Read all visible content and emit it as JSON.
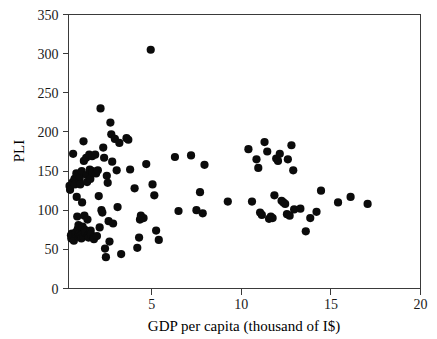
{
  "chart_data": {
    "type": "scatter",
    "title": "",
    "xlabel": "GDP per capita (thousand of I$)",
    "ylabel": "PLI",
    "xlim": [
      0,
      20
    ],
    "ylim": [
      0,
      350
    ],
    "xticks": [
      5,
      10,
      15,
      20
    ],
    "yticks": [
      0,
      50,
      100,
      150,
      200,
      250,
      300,
      350
    ],
    "xtick_labels": [
      "5",
      "10",
      "15",
      "20"
    ],
    "ytick_labels": [
      "0",
      "50",
      "100",
      "150",
      "200",
      "250",
      "300",
      "350"
    ],
    "grid": false,
    "legend": null,
    "marker": "filled-circle",
    "marker_color": "#0b0b0b",
    "marker_size": 4.1,
    "series": [
      {
        "name": "countries",
        "points": [
          [
            0.42,
            131
          ],
          [
            0.45,
            126
          ],
          [
            0.5,
            68
          ],
          [
            0.52,
            64
          ],
          [
            0.55,
            70
          ],
          [
            0.58,
            67
          ],
          [
            0.6,
            136
          ],
          [
            0.62,
            172
          ],
          [
            0.66,
            61
          ],
          [
            0.7,
            140
          ],
          [
            0.72,
            133
          ],
          [
            0.75,
            70
          ],
          [
            0.78,
            72
          ],
          [
            0.8,
            147
          ],
          [
            0.82,
            117
          ],
          [
            0.85,
            92
          ],
          [
            0.88,
            76
          ],
          [
            0.9,
            66
          ],
          [
            0.92,
            81
          ],
          [
            0.95,
            69
          ],
          [
            0.98,
            138
          ],
          [
            1.0,
            143
          ],
          [
            1.02,
            133
          ],
          [
            1.05,
            68
          ],
          [
            1.08,
            64
          ],
          [
            1.1,
            150
          ],
          [
            1.12,
            110
          ],
          [
            1.15,
            79
          ],
          [
            1.18,
            66
          ],
          [
            1.2,
            188
          ],
          [
            1.22,
            163
          ],
          [
            1.25,
            93
          ],
          [
            1.28,
            75
          ],
          [
            1.3,
            71
          ],
          [
            1.35,
            167
          ],
          [
            1.38,
            145
          ],
          [
            1.4,
            136
          ],
          [
            1.42,
            88
          ],
          [
            1.45,
            68
          ],
          [
            1.48,
            65
          ],
          [
            1.52,
            171
          ],
          [
            1.55,
            152
          ],
          [
            1.58,
            140
          ],
          [
            1.6,
            74
          ],
          [
            1.62,
            69
          ],
          [
            1.68,
            169
          ],
          [
            1.7,
            150
          ],
          [
            1.72,
            148
          ],
          [
            1.75,
            65
          ],
          [
            1.78,
            63
          ],
          [
            1.85,
            171
          ],
          [
            1.9,
            147
          ],
          [
            1.95,
            67
          ],
          [
            2.0,
            151
          ],
          [
            2.05,
            118
          ],
          [
            2.1,
            78
          ],
          [
            2.15,
            230
          ],
          [
            2.2,
            100
          ],
          [
            2.25,
            97
          ],
          [
            2.3,
            180
          ],
          [
            2.35,
            167
          ],
          [
            2.4,
            51
          ],
          [
            2.45,
            40
          ],
          [
            2.5,
            144
          ],
          [
            2.55,
            135
          ],
          [
            2.6,
            86
          ],
          [
            2.65,
            60
          ],
          [
            2.7,
            212
          ],
          [
            2.75,
            197
          ],
          [
            2.8,
            162
          ],
          [
            2.85,
            83
          ],
          [
            2.95,
            191
          ],
          [
            3.05,
            151
          ],
          [
            3.1,
            104
          ],
          [
            3.2,
            186
          ],
          [
            3.3,
            44
          ],
          [
            3.6,
            192
          ],
          [
            3.7,
            190
          ],
          [
            3.8,
            152
          ],
          [
            4.05,
            128
          ],
          [
            4.2,
            52
          ],
          [
            4.3,
            65
          ],
          [
            4.35,
            88
          ],
          [
            4.4,
            93
          ],
          [
            4.55,
            90
          ],
          [
            4.7,
            159
          ],
          [
            4.95,
            305
          ],
          [
            5.05,
            133
          ],
          [
            5.15,
            119
          ],
          [
            5.25,
            74
          ],
          [
            5.4,
            62
          ],
          [
            6.3,
            168
          ],
          [
            6.5,
            99
          ],
          [
            7.2,
            170
          ],
          [
            7.5,
            100
          ],
          [
            7.7,
            123
          ],
          [
            7.85,
            96
          ],
          [
            7.95,
            158
          ],
          [
            9.25,
            111
          ],
          [
            10.4,
            178
          ],
          [
            10.6,
            111
          ],
          [
            10.85,
            165
          ],
          [
            10.95,
            154
          ],
          [
            11.05,
            97
          ],
          [
            11.15,
            94
          ],
          [
            11.3,
            187
          ],
          [
            11.45,
            175
          ],
          [
            11.55,
            89
          ],
          [
            11.65,
            92
          ],
          [
            11.75,
            90
          ],
          [
            11.85,
            119
          ],
          [
            11.95,
            166
          ],
          [
            12.05,
            163
          ],
          [
            12.15,
            172
          ],
          [
            12.25,
            112
          ],
          [
            12.35,
            110
          ],
          [
            12.45,
            108
          ],
          [
            12.55,
            95
          ],
          [
            12.6,
            165
          ],
          [
            12.7,
            93
          ],
          [
            12.8,
            183
          ],
          [
            12.9,
            151
          ],
          [
            12.95,
            101
          ],
          [
            13.3,
            102
          ],
          [
            13.6,
            73
          ],
          [
            13.85,
            90
          ],
          [
            14.2,
            98
          ],
          [
            14.45,
            125
          ],
          [
            15.4,
            110
          ],
          [
            16.1,
            117
          ],
          [
            17.05,
            108
          ]
        ]
      }
    ]
  },
  "axes": {
    "x_title": "GDP per capita (thousand of I$)",
    "y_title": "PLI"
  }
}
